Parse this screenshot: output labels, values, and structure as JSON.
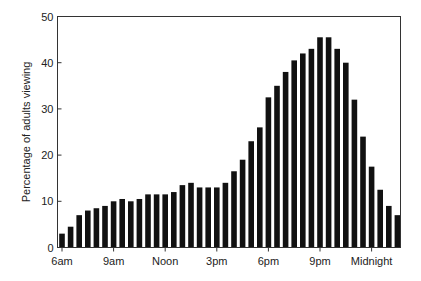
{
  "chart_data": {
    "type": "bar",
    "title": "",
    "xlabel": "",
    "ylabel": "Percentage of adults viewing",
    "ylim": [
      0,
      50
    ],
    "yticks": [
      0,
      10,
      20,
      30,
      40,
      50
    ],
    "grid": false,
    "legend": null,
    "bar_color": "#111111",
    "x_tick_labels": [
      "6am",
      "9am",
      "Noon",
      "3pm",
      "6pm",
      "9pm",
      "Midnight"
    ],
    "x_tick_bar_index": [
      0,
      6,
      12,
      18,
      24,
      30,
      36
    ],
    "categories": [
      "6:00am",
      "6:30am",
      "7:00am",
      "7:30am",
      "8:00am",
      "8:30am",
      "9:00am",
      "9:30am",
      "10:00am",
      "10:30am",
      "11:00am",
      "11:30am",
      "12:00pm",
      "12:30pm",
      "1:00pm",
      "1:30pm",
      "2:00pm",
      "2:30pm",
      "3:00pm",
      "3:30pm",
      "4:00pm",
      "4:30pm",
      "5:00pm",
      "5:30pm",
      "6:00pm",
      "6:30pm",
      "7:00pm",
      "7:30pm",
      "8:00pm",
      "8:30pm",
      "9:00pm",
      "9:30pm",
      "10:00pm",
      "10:30pm",
      "11:00pm",
      "11:30pm",
      "12:00am",
      "12:30am",
      "1:00am",
      "1:30am"
    ],
    "values": [
      3,
      4.5,
      7,
      8,
      8.5,
      9,
      10,
      10.5,
      10,
      10.5,
      11.5,
      11.5,
      11.5,
      12,
      13.5,
      14,
      13,
      13,
      13,
      14,
      16.5,
      19,
      23,
      26,
      32.5,
      35,
      38,
      40.5,
      42,
      43,
      45.5,
      45.5,
      43,
      40,
      32,
      24,
      17.5,
      12.5,
      9,
      7
    ]
  }
}
